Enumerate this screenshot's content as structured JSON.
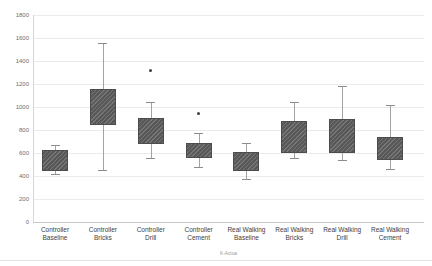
{
  "chart_data": {
    "type": "box",
    "title": "",
    "xlabel": "",
    "ylabel": "",
    "footer_note": "K-Actua",
    "ylim": [
      0,
      1800
    ],
    "y_tick_step": 200,
    "y_tick_labels": [
      "0",
      "200",
      "400",
      "600",
      "800",
      "1000",
      "1200",
      "1400",
      "1600",
      "1800"
    ],
    "grid": true,
    "legend": false,
    "categories": [
      "Controller Baseline",
      "Controller Bricks",
      "Controller Drill",
      "Controller Cement",
      "Real Walking Baseline",
      "Real Walking Bricks",
      "Real Walking Drill",
      "Real Walking Cement"
    ],
    "boxes": [
      {
        "label_lines": [
          "Controller",
          "Baseline"
        ],
        "low": 415,
        "q1": 445,
        "q3": 630,
        "high": 670,
        "outliers": []
      },
      {
        "label_lines": [
          "Controller",
          "Bricks"
        ],
        "low": 450,
        "q1": 845,
        "q3": 1155,
        "high": 1560,
        "outliers": []
      },
      {
        "label_lines": [
          "Controller",
          "Drill"
        ],
        "low": 560,
        "q1": 675,
        "q3": 905,
        "high": 1040,
        "outliers": [
          1320
        ]
      },
      {
        "label_lines": [
          "Controller",
          "Cement"
        ],
        "low": 480,
        "q1": 560,
        "q3": 690,
        "high": 770,
        "outliers": [
          940
        ]
      },
      {
        "label_lines": [
          "Real Walking",
          "Baseline"
        ],
        "low": 370,
        "q1": 440,
        "q3": 610,
        "high": 685,
        "outliers": []
      },
      {
        "label_lines": [
          "Real Walking",
          "Bricks"
        ],
        "low": 560,
        "q1": 600,
        "q3": 880,
        "high": 1040,
        "outliers": []
      },
      {
        "label_lines": [
          "Real Walking",
          "Drill"
        ],
        "low": 540,
        "q1": 600,
        "q3": 900,
        "high": 1180,
        "outliers": []
      },
      {
        "label_lines": [
          "Real Walking",
          "Cement"
        ],
        "low": 460,
        "q1": 540,
        "q3": 740,
        "high": 1020,
        "outliers": []
      }
    ],
    "colors": {
      "box_fill": "#5f5f5f",
      "box_border": "#4c4c4c",
      "whisker": "#a3a3a3",
      "gridline": "#ebebeb",
      "axis": "#c9c9c9",
      "tick_text": "#6e6e6e",
      "outlier": "#3f3f3f"
    }
  }
}
